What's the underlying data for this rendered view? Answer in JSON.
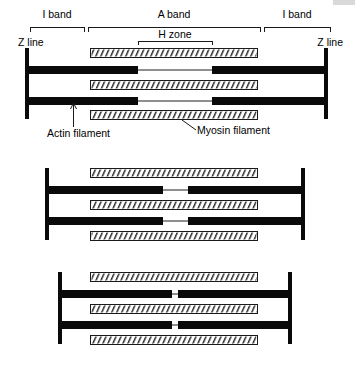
{
  "figure": {
    "background_color": "#ffffff",
    "ink_color": "#0a0a0a",
    "thin_filament_color": "#8f8f8f"
  },
  "labels": {
    "i_band_left": "I band",
    "a_band": "A band",
    "i_band_right": "I band",
    "h_zone": "H zone",
    "z_line_left": "Z line",
    "z_line_right": "Z line",
    "actin_filament": "Actin filament",
    "myosin_filament": "Myosin filament"
  },
  "panels": [
    {
      "name": "relaxed-sarcomere",
      "state": "relaxed",
      "z_line_left_x": 26,
      "z_line_right_x": 326,
      "z_line_top_y": 48,
      "z_line_bottom_y": 119,
      "myosin_left_x": 90,
      "myosin_right_x": 258,
      "h_zone_left_x": 138,
      "h_zone_right_x": 212,
      "myosin_rows_y": [
        48,
        80,
        110
      ],
      "actin_rows_y": [
        67,
        98
      ]
    },
    {
      "name": "partially-contracted-sarcomere",
      "state": "partially contracted",
      "z_line_left_x": 46,
      "z_line_right_x": 303,
      "z_line_top_y": 168,
      "z_line_bottom_y": 240,
      "myosin_left_x": 90,
      "myosin_right_x": 258,
      "h_zone_left_x": 163,
      "h_zone_right_x": 188,
      "myosin_rows_y": [
        168,
        200,
        231
      ],
      "actin_rows_y": [
        187,
        218
      ]
    },
    {
      "name": "fully-contracted-sarcomere",
      "state": "fully contracted",
      "z_line_left_x": 59,
      "z_line_right_x": 290,
      "z_line_top_y": 272,
      "z_line_bottom_y": 344,
      "myosin_left_x": 90,
      "myosin_right_x": 258,
      "h_zone_left_x": 172,
      "h_zone_right_x": 178,
      "myosin_rows_y": [
        272,
        304,
        335
      ],
      "actin_rows_y": [
        291,
        322
      ]
    }
  ],
  "brackets": {
    "i_band_left": {
      "x1": 30,
      "x2": 84,
      "y": 27,
      "label_y": 17
    },
    "a_band": {
      "x1": 88,
      "x2": 260,
      "y": 27,
      "label_y": 17
    },
    "i_band_right": {
      "x1": 264,
      "x2": 330,
      "y": 27,
      "label_y": 17
    },
    "h_zone": {
      "x1": 138,
      "x2": 212,
      "y": 44,
      "label_y": 36
    }
  },
  "callouts": {
    "actin": {
      "label_x": 55,
      "label_y": 133,
      "line_x": 73,
      "line_y1": 128,
      "line_y2": 103
    },
    "myosin": {
      "label_x": 200,
      "label_y": 133,
      "line_x1": 197,
      "line_y1": 128,
      "line_x2": 182,
      "line_y2": 119
    }
  }
}
